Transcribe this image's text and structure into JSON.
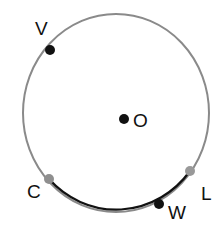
{
  "diagram": {
    "title": "",
    "circle": {
      "cx": 116,
      "cy": 113,
      "rx": 93,
      "ry": 99,
      "stroke": "#8a8a8a",
      "stroke_width": 2
    },
    "highlighted_arc": {
      "from": "C",
      "through": "W",
      "to": "L",
      "stroke": "#111111",
      "stroke_width": 2.2
    },
    "points": [
      {
        "id": "V",
        "label": "V",
        "x": 50,
        "y": 50,
        "color": "#111111",
        "label_x": 35,
        "label_y": 35
      },
      {
        "id": "O",
        "label": "O",
        "x": 124,
        "y": 119,
        "color": "#111111",
        "label_x": 133,
        "label_y": 127
      },
      {
        "id": "C",
        "label": "C",
        "x": 49,
        "y": 179,
        "color": "#8f8f8f",
        "label_x": 27,
        "label_y": 198
      },
      {
        "id": "L",
        "label": "L",
        "x": 190,
        "y": 171,
        "color": "#999999",
        "label_x": 201,
        "label_y": 200
      },
      {
        "id": "W",
        "label": "W",
        "x": 159,
        "y": 204,
        "color": "#111111",
        "label_x": 168,
        "label_y": 219
      }
    ]
  }
}
